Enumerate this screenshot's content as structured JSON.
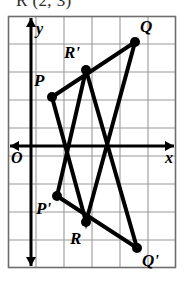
{
  "caption": {
    "text": "R (2, 3)"
  },
  "figure": {
    "colors": {
      "grid_line": "#9a9a9a",
      "border": "#6e6e6e",
      "axis": "#000000",
      "shape_stroke": "#000000",
      "vertex_fill": "#000000",
      "background": "#ffffff"
    },
    "grid": {
      "columns": 6,
      "rows": 9,
      "cell_width": 28,
      "cell_height": 28,
      "left": 8,
      "top": 16,
      "right": 176,
      "bottom": 268
    },
    "axes": {
      "x_axis": {
        "label": "x",
        "y_pixel": 146,
        "arrow_both_ends": true
      },
      "y_axis": {
        "label": "y",
        "x_pixel": 31,
        "arrow_both_ends": true
      },
      "origin_label": "O"
    },
    "vertices": [
      {
        "name": "P",
        "label": "P",
        "px": 52,
        "py": 97,
        "label_x": 34,
        "label_y": 72
      },
      {
        "name": "Q",
        "label": "Q",
        "px": 135,
        "py": 42,
        "label_x": 140,
        "label_y": 18
      },
      {
        "name": "R",
        "label": "R",
        "px": 86,
        "py": 222,
        "label_x": 70,
        "label_y": 230
      },
      {
        "name": "Pp",
        "label": "P'",
        "px": 57,
        "py": 196,
        "label_x": 36,
        "label_y": 200
      },
      {
        "name": "Qp",
        "label": "Q'",
        "px": 137,
        "py": 248,
        "label_x": 142,
        "label_y": 252
      },
      {
        "name": "Rp",
        "label": "R'",
        "px": 86,
        "py": 70,
        "label_x": 64,
        "label_y": 44
      }
    ],
    "triangles": [
      {
        "name": "triangle-PQR",
        "vertices": [
          "P",
          "Q",
          "R"
        ]
      },
      {
        "name": "triangle-image",
        "vertices": [
          "Pp",
          "Qp",
          "Rp"
        ]
      }
    ],
    "stroke_width": 4,
    "vertex_radius": 5
  }
}
